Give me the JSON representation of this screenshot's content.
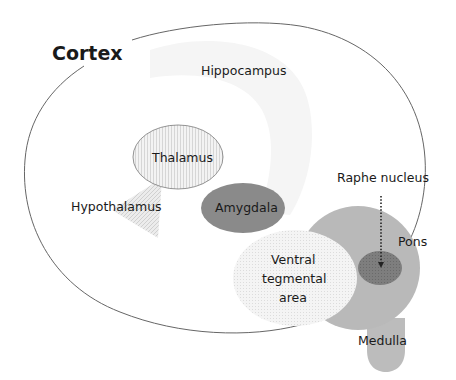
{
  "diagram": {
    "title": "Cortex",
    "regions": [
      {
        "id": "hippocampus",
        "label": "Hippocampus",
        "fill": "#f4f4f4"
      },
      {
        "id": "thalamus",
        "label": "Thalamus",
        "fill": "#eeeeee",
        "stroke": "#777777"
      },
      {
        "id": "hypothalamus",
        "label": "Hypothalamus",
        "fill": "#e2e2e2"
      },
      {
        "id": "amygdala",
        "label": "Amygdala",
        "fill": "#8a8a8a"
      },
      {
        "id": "vta",
        "label_lines": [
          "Ventral",
          "tegmental",
          "area"
        ],
        "fill": "#efefef"
      },
      {
        "id": "pons",
        "label": "Pons",
        "fill": "#b9b9b9"
      },
      {
        "id": "raphe",
        "label": "Raphe nucleus",
        "fill": "#7c7c7c"
      },
      {
        "id": "medulla",
        "label": "Medulla",
        "fill": "#bcbcbc"
      }
    ],
    "outline_color": "#555555"
  }
}
